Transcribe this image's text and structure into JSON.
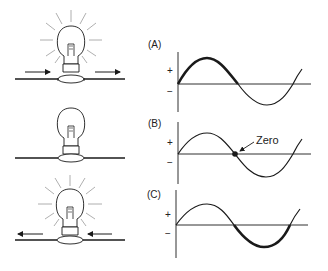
{
  "figure": {
    "panels": [
      {
        "id": "A",
        "label": "(A)",
        "plus": "+",
        "minus": "−",
        "bulb_state": "lit",
        "current_direction": "right",
        "highlight": "positive half-cycle"
      },
      {
        "id": "B",
        "label": "(B)",
        "plus": "+",
        "minus": "−",
        "bulb_state": "dim",
        "current_direction": "none",
        "highlight": "zero crossing",
        "annotation": "Zero"
      },
      {
        "id": "C",
        "label": "(C)",
        "plus": "+",
        "minus": "−",
        "bulb_state": "lit",
        "current_direction": "left",
        "highlight": "negative half-cycle"
      }
    ]
  },
  "colors": {
    "line": "#1a1a1a",
    "ray": "#9a9a9a",
    "background": "#ffffff"
  }
}
